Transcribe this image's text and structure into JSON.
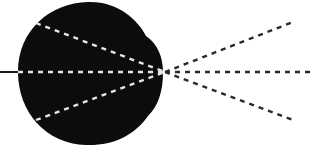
{
  "diagram": {
    "colors": {
      "background": "#ffffff",
      "blob": "#0c0c0c",
      "line": "#1a1a1a",
      "dash_inside": "#e6e6e6",
      "dash_outside": "#2a2a2a"
    },
    "input_line": {
      "x1": 0,
      "y1": 72,
      "x2": 18,
      "y2": 72
    },
    "focal_point": {
      "x": 165,
      "y": 72
    },
    "rays_inside": [
      {
        "name": "upper",
        "x1": 36,
        "y1": 23,
        "x2": 165,
        "y2": 72
      },
      {
        "name": "center",
        "x1": 18,
        "y1": 72,
        "x2": 165,
        "y2": 72
      },
      {
        "name": "lower",
        "x1": 36,
        "y1": 120,
        "x2": 165,
        "y2": 72
      }
    ],
    "rays_outside": [
      {
        "name": "upper",
        "x1": 165,
        "y1": 72,
        "x2": 293,
        "y2": 22
      },
      {
        "name": "center",
        "x1": 165,
        "y1": 72,
        "x2": 314,
        "y2": 72
      },
      {
        "name": "lower",
        "x1": 165,
        "y1": 72,
        "x2": 293,
        "y2": 120
      }
    ]
  }
}
